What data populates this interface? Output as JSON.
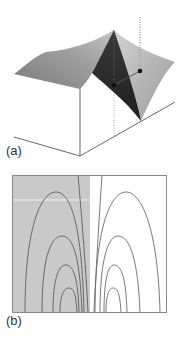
{
  "figure": {
    "panels": [
      {
        "id": "a",
        "label": "(a)",
        "type": "3d-surface",
        "description": "Surface with a sharp ridge/peak; dark and light faces, two dotted vertical guide lines and two connected sample points"
      },
      {
        "id": "b",
        "label": "(b)",
        "type": "contour",
        "description": "Contour plot with nested arch-shaped level curves on left (shaded) and right (white) halves"
      }
    ]
  },
  "colors": {
    "surface_light": "#a8a8a8",
    "surface_mid": "#8c8c8c",
    "surface_dark": "#2a2a2a",
    "surface_right": "#b5b5b5",
    "axis": "#555555",
    "contour_line": "#666666",
    "shaded_region": "#c8c8c8",
    "frame": "#888888"
  }
}
